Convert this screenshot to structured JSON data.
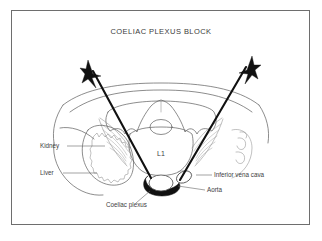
{
  "figure": {
    "title": "COELIAC PLEXUS BLOCK",
    "vertebra_label": "L1",
    "frame_color": "#6e6e6e",
    "line_color": "#5c5c5c",
    "needle_color": "#111111",
    "text_color": "#3d3d3d",
    "background": "#ffffff"
  },
  "annotations": {
    "kidney": "Kidney",
    "liver": "Liver",
    "inferior_vena_cava": "Inferior vena cava",
    "aorta": "Aorta",
    "coeliac_plexus": "Coeliac plexus"
  }
}
